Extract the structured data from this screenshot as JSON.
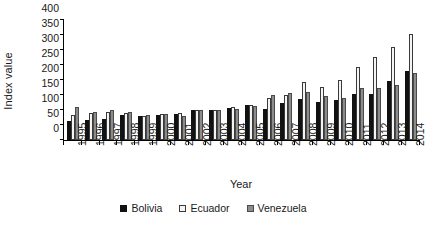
{
  "chart_data": {
    "type": "bar",
    "title": "",
    "xlabel": "Year",
    "ylabel": "Index value",
    "categories": [
      "1995",
      "1996",
      "1997",
      "1998",
      "1999",
      "2000",
      "2001",
      "2002",
      "2003",
      "2004",
      "2005",
      "2006",
      "2007",
      "2008",
      "2009",
      "2010",
      "2011",
      "2012",
      "2013",
      "2014"
    ],
    "series": [
      {
        "name": "Bolivia",
        "color": "#111111",
        "values": [
          62,
          68,
          70,
          83,
          80,
          85,
          88,
          100,
          100,
          108,
          118,
          105,
          125,
          137,
          128,
          132,
          153,
          155,
          198,
          230
        ]
      },
      {
        "name": "Ecuador",
        "color": "#f4f4f4",
        "values": [
          85,
          90,
          93,
          90,
          80,
          88,
          90,
          100,
          100,
          110,
          118,
          140,
          150,
          195,
          178,
          200,
          245,
          278,
          310,
          355
        ]
      },
      {
        "name": "Venezuela",
        "color": "#8c8c8c",
        "values": [
          110,
          92,
          100,
          95,
          82,
          88,
          80,
          100,
          100,
          105,
          113,
          150,
          158,
          160,
          148,
          140,
          172,
          175,
          185,
          225
        ]
      }
    ],
    "ylim": [
      0,
      400
    ],
    "yticks": [
      0,
      50,
      100,
      150,
      200,
      250,
      300,
      350,
      400
    ],
    "grid": false,
    "legend_position": "bottom"
  },
  "legend": {
    "items": [
      {
        "label": "Bolivia"
      },
      {
        "label": "Ecuador"
      },
      {
        "label": "Venezuela"
      }
    ]
  }
}
